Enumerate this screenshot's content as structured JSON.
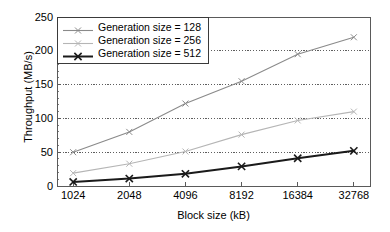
{
  "chart_data": {
    "type": "line",
    "title": "",
    "xlabel": "Block size (kB)",
    "ylabel": "Throughput (MB/s)",
    "categories": [
      "1024",
      "2048",
      "4096",
      "8192",
      "16384",
      "32768"
    ],
    "ylim": [
      0,
      250
    ],
    "yticks": [
      "0",
      "50",
      "100",
      "150",
      "200",
      "250"
    ],
    "grid": "horizontal-dotted",
    "legend_position": "top-left-inside",
    "series": [
      {
        "name": "Generation size = 128",
        "values": [
          50,
          80,
          122,
          155,
          195,
          220
        ],
        "color": "#8a8a8a",
        "marker": "x",
        "width": 1.1
      },
      {
        "name": "Generation size = 256",
        "values": [
          19,
          33,
          51,
          76,
          97,
          110
        ],
        "color": "#b5b5b5",
        "marker": "x",
        "width": 1.1
      },
      {
        "name": "Generation size = 512",
        "values": [
          6,
          11,
          18,
          29,
          41,
          52
        ],
        "color": "#1a1a1a",
        "marker": "x",
        "width": 2.0
      }
    ]
  },
  "axes": {
    "frame_color": "#5a5a5a",
    "grid_color": "#4d4d4d"
  }
}
